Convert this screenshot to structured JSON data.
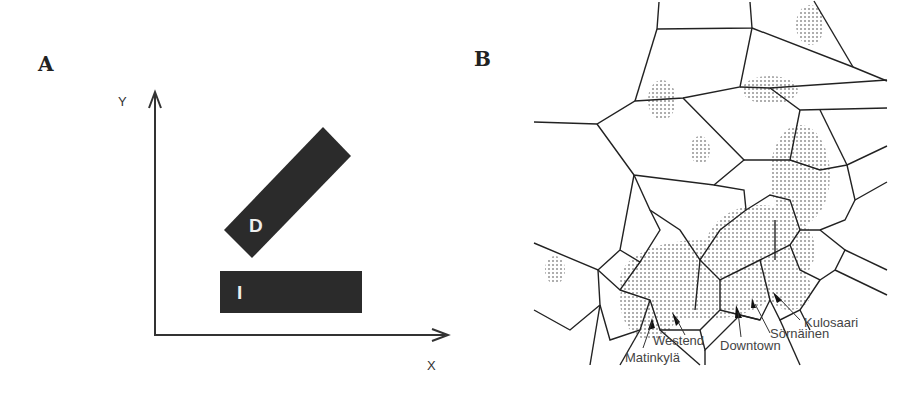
{
  "figure": {
    "panels": [
      {
        "label": "A",
        "x_axis_label": "X",
        "y_axis_label": "Y",
        "shapes": [
          {
            "id": "D",
            "label": "D",
            "description": "rectangle rotated ~45 degrees"
          },
          {
            "id": "I",
            "label": "I",
            "description": "horizontal rectangle"
          }
        ]
      },
      {
        "label": "B",
        "description": "Voronoi tessellation over a city map",
        "place_labels": [
          "Kulosaari",
          "Sörnäinen",
          "Downtown",
          "Westend",
          "Matinkylä"
        ]
      }
    ]
  },
  "colors": {
    "shape_fill": "#2b2b2b",
    "line": "#222222",
    "map_dots": "#9a9a9a"
  }
}
